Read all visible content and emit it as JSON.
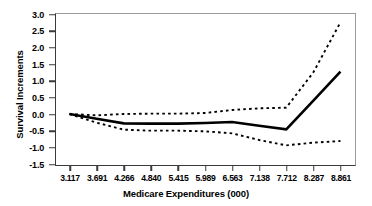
{
  "chart_data": {
    "type": "line",
    "title": "",
    "xlabel": "Medicare Expenditures (000)",
    "ylabel": "Survival Increments",
    "categories": [
      "3.117",
      "3.691",
      "4.266",
      "4.840",
      "5.415",
      "5.989",
      "6.563",
      "7.138",
      "7.712",
      "8.287",
      "8.861"
    ],
    "x": [
      3.117,
      3.691,
      4.266,
      4.84,
      5.415,
      5.989,
      6.563,
      7.138,
      7.712,
      8.287,
      8.861
    ],
    "ylim": [
      -1.5,
      3.0
    ],
    "yticks": [
      "3.0",
      "2.5",
      "2.0",
      "1.5",
      "1.0",
      "0.5",
      "0.0",
      "-0.5",
      "-1.0",
      "-1.5"
    ],
    "ytick_values": [
      3.0,
      2.5,
      2.0,
      1.5,
      1.0,
      0.5,
      0.0,
      -0.5,
      -1.0,
      -1.5
    ],
    "grid": false,
    "legend": "none",
    "series": [
      {
        "name": "Survival increment estimate",
        "style": "solid",
        "color": "#000000",
        "width": 2.6,
        "values": [
          0.0,
          -0.14,
          -0.28,
          -0.29,
          -0.29,
          -0.27,
          -0.24,
          -0.35,
          -0.46,
          0.4,
          1.27
        ]
      },
      {
        "name": "Upper confidence bound",
        "style": "dashed",
        "color": "#000000",
        "width": 1.9,
        "values": [
          0.0,
          -0.04,
          0.0,
          0.01,
          0.01,
          0.03,
          0.12,
          0.17,
          0.19,
          1.25,
          2.75
        ]
      },
      {
        "name": "Lower confidence bound",
        "style": "dashed",
        "color": "#000000",
        "width": 1.9,
        "values": [
          0.0,
          -0.26,
          -0.47,
          -0.5,
          -0.5,
          -0.52,
          -0.58,
          -0.78,
          -0.94,
          -0.86,
          -0.81
        ]
      }
    ]
  }
}
